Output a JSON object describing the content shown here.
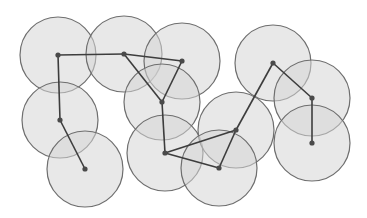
{
  "diagram": {
    "type": "unit-disk-graph",
    "width": 367,
    "height": 218,
    "colors": {
      "background": "#ffffff",
      "disk_fill": "#d6d6d6",
      "disk_stroke": "#6e6e6e",
      "edge": "#3d3d3d",
      "node": "#4a4a4a"
    },
    "disk_radius": 38,
    "nodes": [
      {
        "id": "A",
        "x": 58,
        "y": 55
      },
      {
        "id": "B",
        "x": 124,
        "y": 54
      },
      {
        "id": "C",
        "x": 182,
        "y": 61
      },
      {
        "id": "D",
        "x": 162,
        "y": 102
      },
      {
        "id": "E",
        "x": 60,
        "y": 120
      },
      {
        "id": "F",
        "x": 85,
        "y": 169
      },
      {
        "id": "G",
        "x": 165,
        "y": 153
      },
      {
        "id": "H",
        "x": 236,
        "y": 130
      },
      {
        "id": "I",
        "x": 219,
        "y": 168
      },
      {
        "id": "J",
        "x": 273,
        "y": 63
      },
      {
        "id": "K",
        "x": 312,
        "y": 98
      },
      {
        "id": "L",
        "x": 312,
        "y": 143
      }
    ],
    "edges": [
      [
        "A",
        "B"
      ],
      [
        "B",
        "C"
      ],
      [
        "A",
        "E"
      ],
      [
        "E",
        "F"
      ],
      [
        "B",
        "D"
      ],
      [
        "C",
        "D"
      ],
      [
        "D",
        "G"
      ],
      [
        "G",
        "H"
      ],
      [
        "G",
        "I"
      ],
      [
        "I",
        "H"
      ],
      [
        "H",
        "J"
      ],
      [
        "J",
        "K"
      ],
      [
        "K",
        "L"
      ]
    ]
  }
}
